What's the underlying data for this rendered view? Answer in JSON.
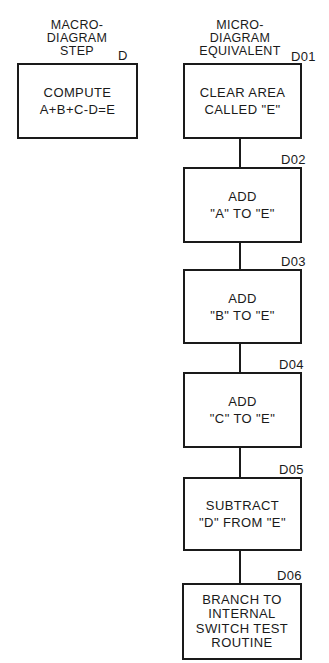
{
  "macro": {
    "header": [
      "MACRO-",
      "DIAGRAM",
      "STEP"
    ],
    "step_id": "D",
    "box_lines": [
      "COMPUTE",
      "A+B+C-D=E"
    ]
  },
  "micro": {
    "header": [
      "MICRO-",
      "DIAGRAM",
      "EQUIVALENT"
    ],
    "steps": [
      {
        "id": "D01",
        "lines": [
          "CLEAR AREA",
          "CALLED \"E\""
        ]
      },
      {
        "id": "D02",
        "lines": [
          "ADD",
          "\"A\" TO \"E\""
        ]
      },
      {
        "id": "D03",
        "lines": [
          "ADD",
          "\"B\" TO \"E\""
        ]
      },
      {
        "id": "D04",
        "lines": [
          "ADD",
          "\"C\" TO \"E\""
        ]
      },
      {
        "id": "D05",
        "lines": [
          "SUBTRACT",
          "\"D\" FROM \"E\""
        ]
      },
      {
        "id": "D06",
        "lines": [
          "BRANCH TO",
          "INTERNAL",
          "SWITCH TEST",
          "ROUTINE"
        ]
      }
    ]
  }
}
